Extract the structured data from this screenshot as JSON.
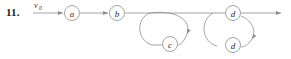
{
  "problem": {
    "number": "11."
  },
  "diagram": {
    "type": "directed-walk-graph",
    "start_label": "v",
    "start_label_subscript": "0",
    "nodes": [
      {
        "id": "a",
        "label": "a",
        "cx": 72,
        "cy": 13,
        "r": 7.5
      },
      {
        "id": "b",
        "label": "b",
        "cx": 117,
        "cy": 13,
        "r": 7.5
      },
      {
        "id": "c",
        "label": "c",
        "cx": 170,
        "cy": 44,
        "r": 7.5
      },
      {
        "id": "d1",
        "label": "d",
        "cx": 233,
        "cy": 13,
        "r": 7.5
      },
      {
        "id": "d2",
        "label": "d",
        "cx": 233,
        "cy": 45,
        "r": 7.5
      }
    ],
    "edges": [
      {
        "from": "start",
        "to": "a",
        "shape": "line",
        "arrow": true
      },
      {
        "from": "a",
        "to": "b",
        "shape": "line",
        "arrow": true
      },
      {
        "from": "b",
        "to": "loop-c",
        "shape": "line",
        "arrow": false
      },
      {
        "from": "loop-c",
        "to": "c",
        "shape": "loop",
        "arrow": true
      },
      {
        "from": "c",
        "to": "loop-c-exit",
        "shape": "loop",
        "arrow": false
      },
      {
        "from": "d1",
        "to": "d2",
        "shape": "loop",
        "arrow": true
      },
      {
        "from": "d2",
        "to": "d1",
        "shape": "loop",
        "arrow": false
      },
      {
        "from": "d1",
        "to": "end",
        "shape": "line",
        "arrow": true
      }
    ],
    "colors": {
      "stroke": "#8d8d8d",
      "text": "#2b2b2b",
      "background": "#ffffff"
    }
  }
}
